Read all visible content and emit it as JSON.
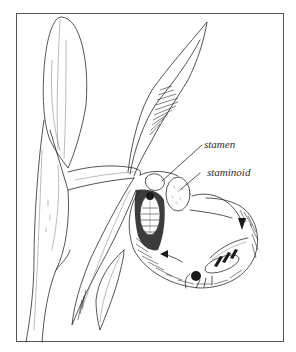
{
  "figure": {
    "labels": {
      "stamen": "stamen",
      "staminoid": "staminoid"
    },
    "colors": {
      "ink": "#2a2a2a",
      "background": "#ffffff",
      "frame": "#555555"
    }
  }
}
